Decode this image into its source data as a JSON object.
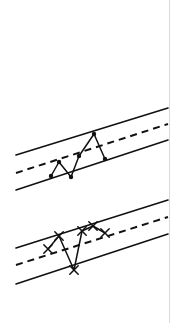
{
  "page": {
    "background_color": "#ffffff",
    "ink_color": "#111111",
    "border_color": "#d9d9d9",
    "width": 175,
    "height": 323
  },
  "figure": {
    "title": "",
    "caption": ""
  },
  "chart_data": [
    {
      "type": "line",
      "name": "upper-chart",
      "title": "",
      "subtitle": "",
      "xlabel": "",
      "ylabel": "",
      "xlim": [
        0,
        175
      ],
      "ylim": [
        0,
        323
      ],
      "grid": false,
      "legend": "none",
      "marker": "filled-dot",
      "axes_visible": false,
      "annotations": [],
      "bands": [
        {
          "name": "upper-control-limit",
          "style": "solid",
          "stroke_width": 1.6,
          "x1": 16,
          "y1": 155,
          "x2": 168,
          "y2": 108
        },
        {
          "name": "centre-trend-line",
          "style": "dashed",
          "stroke_width": 2.0,
          "dash": "7,5",
          "x1": 16,
          "y1": 173,
          "x2": 168,
          "y2": 124
        },
        {
          "name": "lower-control-limit",
          "style": "solid",
          "stroke_width": 1.6,
          "x1": 16,
          "y1": 190,
          "x2": 168,
          "y2": 140
        }
      ],
      "series": [
        {
          "name": "observations",
          "points": [
            {
              "x": 51,
              "y": 176
            },
            {
              "x": 59,
              "y": 162
            },
            {
              "x": 71,
              "y": 177
            },
            {
              "x": 79,
              "y": 156
            },
            {
              "x": 94,
              "y": 134
            },
            {
              "x": 105,
              "y": 159
            }
          ]
        }
      ]
    },
    {
      "type": "line",
      "name": "lower-chart",
      "title": "",
      "subtitle": "",
      "xlabel": "",
      "ylabel": "",
      "xlim": [
        0,
        175
      ],
      "ylim": [
        0,
        323
      ],
      "grid": false,
      "legend": "none",
      "marker": "cross-x",
      "axes_visible": false,
      "annotations": [],
      "bands": [
        {
          "name": "upper-control-limit",
          "style": "solid",
          "stroke_width": 1.6,
          "x1": 16,
          "y1": 248,
          "x2": 168,
          "y2": 200
        },
        {
          "name": "centre-trend-line",
          "style": "dashed",
          "stroke_width": 2.0,
          "dash": "7,5",
          "x1": 16,
          "y1": 265,
          "x2": 168,
          "y2": 217
        },
        {
          "name": "lower-control-limit",
          "style": "solid",
          "stroke_width": 1.6,
          "x1": 16,
          "y1": 284,
          "x2": 168,
          "y2": 234
        }
      ],
      "series": [
        {
          "name": "observations",
          "points": [
            {
              "x": 48,
              "y": 249
            },
            {
              "x": 59,
              "y": 236
            },
            {
              "x": 74,
              "y": 270
            },
            {
              "x": 82,
              "y": 231
            },
            {
              "x": 93,
              "y": 226
            },
            {
              "x": 105,
              "y": 233
            }
          ]
        }
      ]
    }
  ]
}
